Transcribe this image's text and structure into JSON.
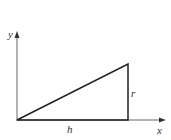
{
  "diagram": {
    "type": "right-triangle-on-axes",
    "axes": {
      "x_label": "x",
      "y_label": "y"
    },
    "triangle": {
      "base_label": "h",
      "height_label": "r",
      "vertices": [
        [
          0,
          0
        ],
        [
          1,
          0
        ],
        [
          1,
          1
        ]
      ]
    },
    "colors": {
      "line": "#222222",
      "axis": "#555555",
      "background": "#ffffff"
    }
  }
}
